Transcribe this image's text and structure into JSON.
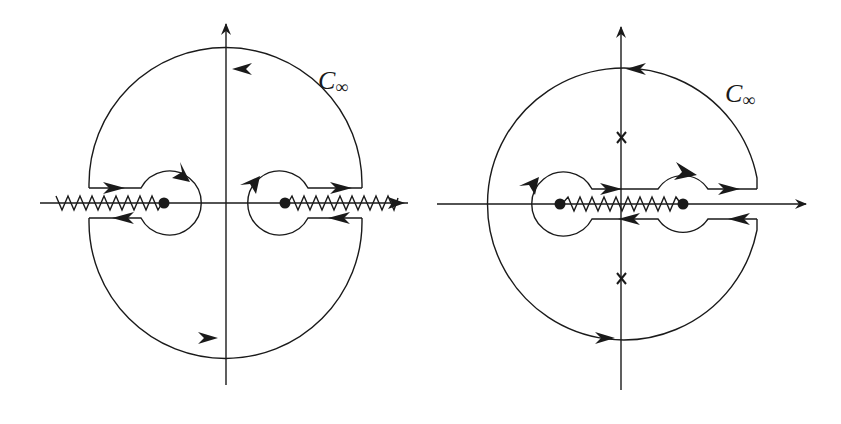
{
  "figure": {
    "stroke_color": "#1a1a1a",
    "background": "#ffffff"
  },
  "left_panel": {
    "contour_label": "C",
    "contour_label_sub": "∞",
    "branch_points": 2,
    "branch_cuts": "outward along real axis from each branch point",
    "poles": 0
  },
  "right_panel": {
    "contour_label": "C",
    "contour_label_sub": "∞",
    "branch_points": 2,
    "branch_cuts": "single cut joining the two branch points",
    "poles_marker": "x",
    "poles": 2
  }
}
